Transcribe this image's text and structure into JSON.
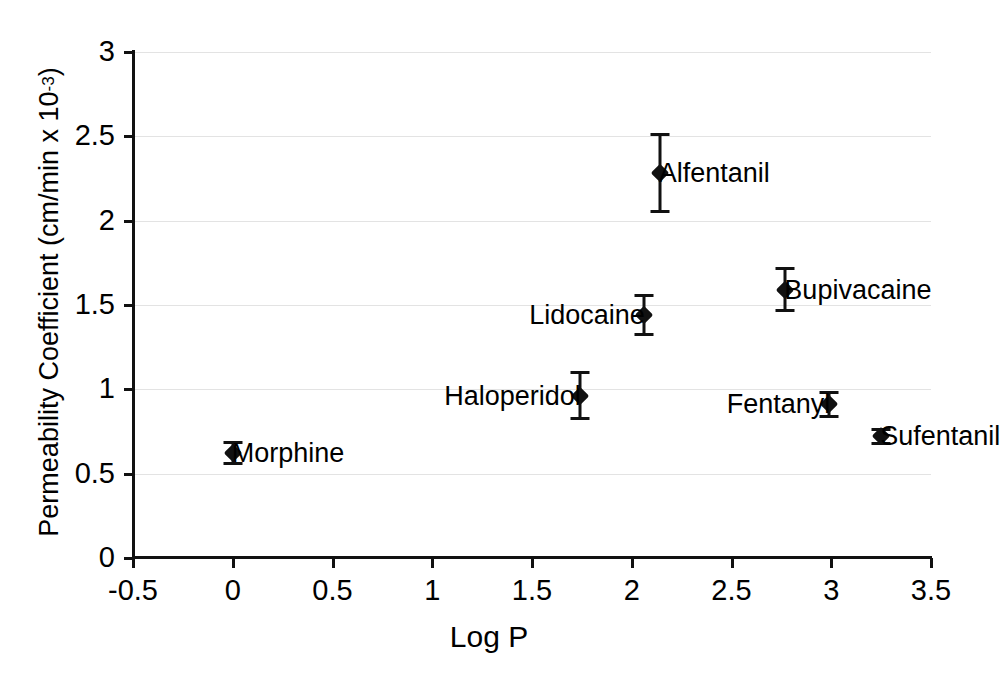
{
  "chart_data": {
    "type": "scatter",
    "title": "",
    "xlabel": "Log P",
    "ylabel": "Permeability Coefficient (cm/min x 10",
    "ylabel_exponent": "-3",
    "ylabel_suffix": ")",
    "xlim": [
      -0.5,
      3.5
    ],
    "ylim": [
      0,
      3
    ],
    "xticks": [
      "-0.5",
      "0",
      "0.5",
      "1",
      "1.5",
      "2",
      "2.5",
      "3",
      "3.5"
    ],
    "xtick_values": [
      -0.5,
      0,
      0.5,
      1,
      1.5,
      2,
      2.5,
      3,
      3.5
    ],
    "yticks": [
      "0",
      "0.5",
      "1",
      "1.5",
      "2",
      "2.5",
      "3"
    ],
    "ytick_values": [
      0,
      0.5,
      1,
      1.5,
      2,
      2.5,
      3
    ],
    "grid": "horizontal",
    "legend": "none",
    "marker": "filled-diamond",
    "error_bars": "vertical",
    "points": [
      {
        "label": "Morphine",
        "x": 0.0,
        "y": 0.61,
        "yerr_low": 0.07,
        "yerr_high": 0.07,
        "label_side": "right"
      },
      {
        "label": "Haloperidol",
        "x": 1.74,
        "y": 0.95,
        "yerr_low": 0.15,
        "yerr_high": 0.14,
        "label_side": "left"
      },
      {
        "label": "Lidocaine",
        "x": 2.06,
        "y": 1.43,
        "yerr_low": 0.12,
        "yerr_high": 0.13,
        "label_side": "left"
      },
      {
        "label": "Alfentanil",
        "x": 2.14,
        "y": 2.27,
        "yerr_low": 0.24,
        "yerr_high": 0.23,
        "label_side": "right"
      },
      {
        "label": "Bupivacaine",
        "x": 2.77,
        "y": 1.58,
        "yerr_low": 0.14,
        "yerr_high": 0.13,
        "label_side": "right"
      },
      {
        "label": "Fentanyl",
        "x": 2.99,
        "y": 0.9,
        "yerr_low": 0.08,
        "yerr_high": 0.08,
        "label_side": "left"
      },
      {
        "label": "Sufentanil",
        "x": 3.25,
        "y": 0.71,
        "yerr_low": 0.05,
        "yerr_high": 0.05,
        "label_side": "right"
      }
    ]
  },
  "caption": {
    "text": ""
  }
}
